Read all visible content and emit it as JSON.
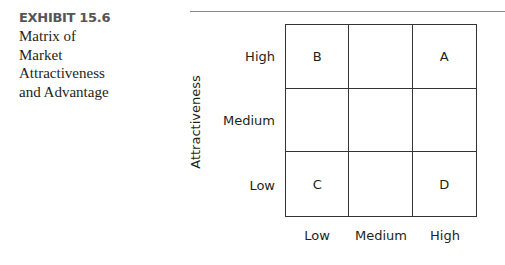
{
  "caption": {
    "exhibit": "EXHIBIT 15.6",
    "title_lines": [
      "Matrix of",
      "Market",
      "Attractiveness",
      "and Advantage"
    ]
  },
  "matrix": {
    "y_axis_label": "Attractiveness",
    "row_labels": [
      "High",
      "Medium",
      "Low"
    ],
    "col_labels": [
      "Low",
      "Medium",
      "High"
    ],
    "cells": [
      [
        "B",
        "",
        "A"
      ],
      [
        "",
        "",
        ""
      ],
      [
        "C",
        "",
        "D"
      ]
    ]
  }
}
